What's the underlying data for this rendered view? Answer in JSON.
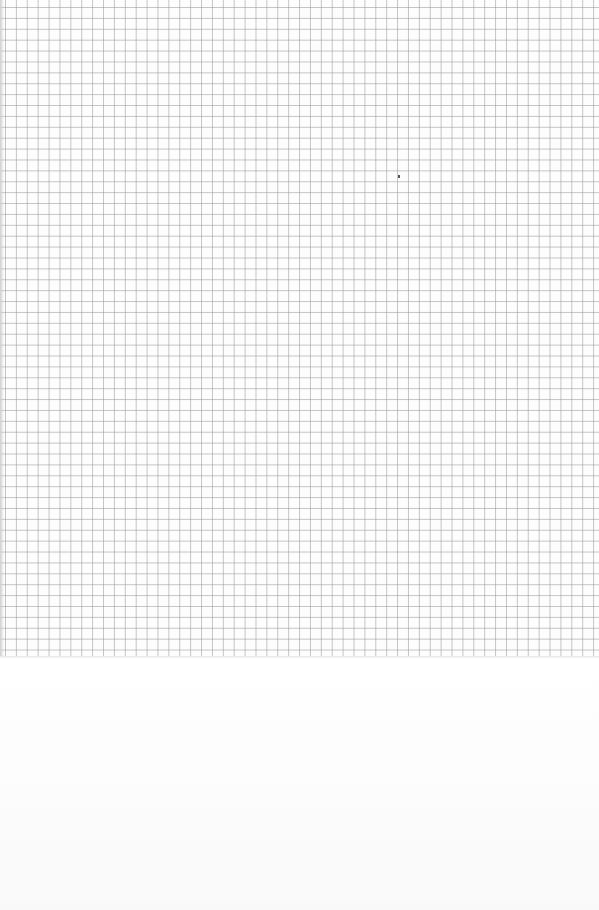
{
  "image": {
    "subject": "graph paper sheet",
    "grid_color": "#969696",
    "paper_color": "#ffffff",
    "grid_height_px": 658,
    "grid_pitch_px": 11,
    "speck": {
      "x": 399,
      "y": 176
    }
  }
}
